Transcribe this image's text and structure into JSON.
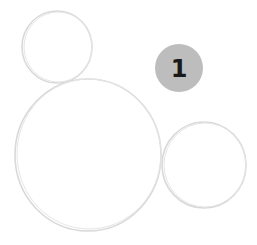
{
  "diagram": {
    "circles": [
      {
        "id": "small-top-left",
        "cx": 57,
        "cy": 47,
        "r": 35
      },
      {
        "id": "large-center",
        "cx": 88,
        "cy": 155,
        "r": 73
      },
      {
        "id": "medium-right",
        "cx": 204,
        "cy": 165,
        "r": 42
      }
    ],
    "stroke_color": "#d9d9d9",
    "badge": {
      "label": "1",
      "cx": 179,
      "cy": 68,
      "r": 24,
      "fill": "#bdbdbd",
      "text_color": "#1a1a1a"
    }
  }
}
